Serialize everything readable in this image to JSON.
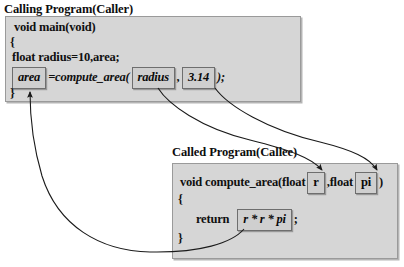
{
  "diagram": {
    "title_caller": "Calling Program(Caller)",
    "title_callee": "Called Program(Callee)",
    "colors": {
      "box_fill": "#d6d6d6",
      "box_border": "#9a9a9a",
      "var_fill": "#cfcfcf",
      "var_border": "#6e6e6e",
      "arrow": "#1a1a1a",
      "background": "#ffffff",
      "text": "#101010"
    }
  },
  "caller": {
    "caption": "Calling Program(Caller)",
    "lines": {
      "signature": "void main(void)",
      "open_brace": "{",
      "declaration": "float radius=10,area;",
      "call_prefix": "=compute_area(",
      "call_separator": ",",
      "call_suffix": ");",
      "close_brace": "}"
    },
    "variables": {
      "result": "area",
      "arg1": "radius",
      "arg2": "3.14"
    }
  },
  "callee": {
    "caption": "Called Program(Callee)",
    "lines": {
      "signature_prefix": "void compute_area(float",
      "signature_separator": ",float",
      "signature_suffix": ")",
      "open_brace": "{",
      "return_keyword": "return",
      "return_suffix": ";",
      "close_brace": "}"
    },
    "variables": {
      "param1": "r",
      "param2": "pi",
      "return_expression": "r * r * pi"
    }
  },
  "arrows": [
    {
      "name": "argument-radius-to-r",
      "from": "radius",
      "to": "r",
      "direction": "caller-to-callee"
    },
    {
      "name": "argument-pi-to-pi",
      "from": "3.14",
      "to": "pi",
      "direction": "caller-to-callee"
    },
    {
      "name": "return-value-to-area",
      "from": "r * r * pi",
      "to": "area",
      "direction": "callee-to-caller"
    }
  ]
}
